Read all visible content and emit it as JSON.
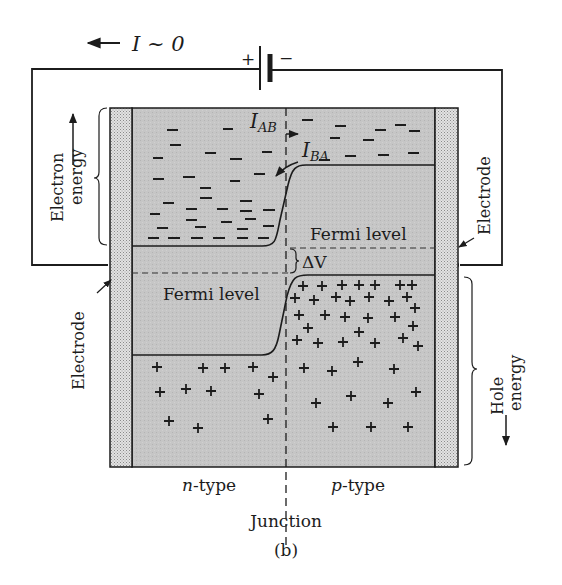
{
  "figure": {
    "caption": "(b)",
    "current_label": "I ~ 0",
    "battery": {
      "plus": "+",
      "minus": "−"
    },
    "labels": {
      "electron_energy_line1": "Electron",
      "electron_energy_line2": "energy",
      "hole_energy_line1": "Hole",
      "hole_energy_line2": "energy",
      "electrode_left": "Electrode",
      "electrode_right": "Electrode",
      "fermi_level_left": "Fermi level",
      "fermi_level_right": "Fermi level",
      "delta_v": "ΔV",
      "i_ab_main": "I",
      "i_ab_sub": "AB",
      "i_ba_main": "I",
      "i_ba_sub": "BA",
      "n_type_italic": "n",
      "n_type_rest": "-type",
      "p_type_italic": "p",
      "p_type_rest": "-type",
      "junction": "Junction"
    },
    "colors": {
      "semiconductor_fill": "#c4c4c4",
      "electrode_fill": "#d6d6d6",
      "ink": "#1c1c1c",
      "background": "#ffffff"
    },
    "carriers": {
      "electron_symbol": "−",
      "hole_symbol": "+",
      "electron_count": 44,
      "hole_count": 60
    }
  }
}
